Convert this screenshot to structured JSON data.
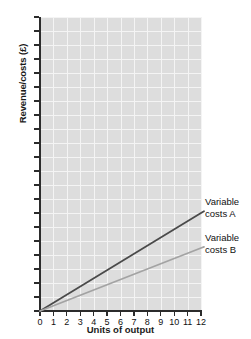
{
  "chart_data": {
    "type": "line",
    "title": "",
    "xlabel": "Units of output",
    "ylabel": "Revenue/costs (£)",
    "xlim": [
      0,
      12
    ],
    "ylim": [
      0,
      210
    ],
    "xticks": [
      0,
      1,
      2,
      3,
      4,
      5,
      6,
      7,
      8,
      9,
      10,
      11,
      12
    ],
    "yticks": [
      0,
      10,
      20,
      30,
      40,
      50,
      60,
      70,
      80,
      90,
      100,
      110,
      120,
      130,
      140,
      150,
      160,
      170,
      180,
      190,
      200,
      210
    ],
    "grid": true,
    "legend_position": "right-inline",
    "x": [
      0,
      12
    ],
    "series": [
      {
        "name": "Variable costs A",
        "label_line1": "Variable",
        "label_line2": "costs A",
        "color": "#4a4a4a",
        "values": [
          0,
          70
        ],
        "slope": 5.83
      },
      {
        "name": "Variable costs B",
        "label_line1": "Variable",
        "label_line2": "costs B",
        "color": "#a3a3a3",
        "values": [
          0,
          45
        ],
        "slope": 3.75
      }
    ],
    "plot_background": "#dddddd",
    "gridline_color": "#f4f4f4",
    "axis_color": "#2b2b2b"
  }
}
